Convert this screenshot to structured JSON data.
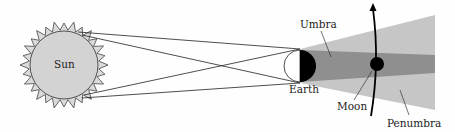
{
  "diagram": {
    "labels": {
      "sun": "Sun",
      "earth": "Earth",
      "moon": "Moon",
      "umbra": "Umbra",
      "penumbra": "Penumbra"
    },
    "colors": {
      "sun_fill": "#d4d4d4",
      "corona_fill": "#d9d9d9",
      "outline": "#333333",
      "penumbra": "#c4c4c4",
      "umbra": "#8e8e8e",
      "earth_night": "#000000",
      "earth_day": "#ffffff",
      "moon": "#000000"
    }
  }
}
